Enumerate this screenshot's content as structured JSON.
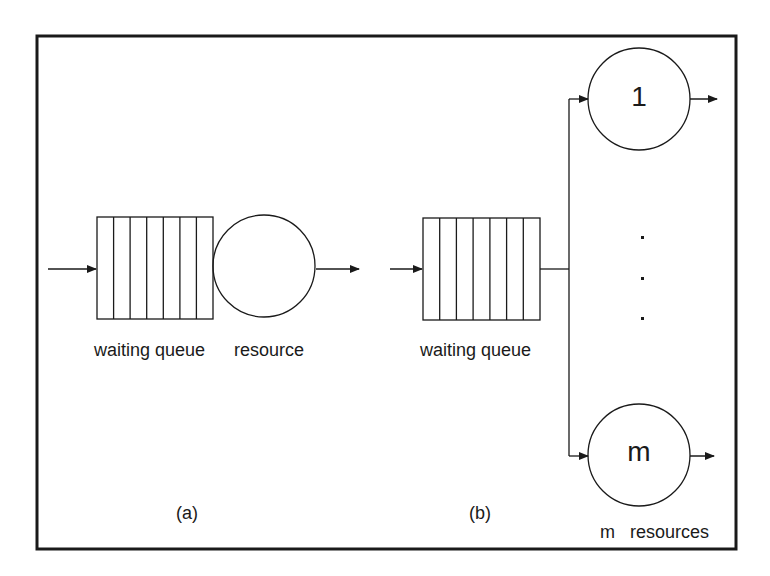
{
  "diagram": {
    "panel_a": {
      "caption": "(a)",
      "queue_label": "waiting queue",
      "resource_label": "resource",
      "queue_slots": 7
    },
    "panel_b": {
      "caption": "(b)",
      "queue_label": "waiting queue",
      "queue_slots": 7,
      "server_first": "1",
      "server_last": "m",
      "servers_label": "m   resources",
      "ellipsis": "vertical dots"
    },
    "colors": {
      "stroke": "#1a1a1a",
      "background": "#ffffff"
    }
  }
}
